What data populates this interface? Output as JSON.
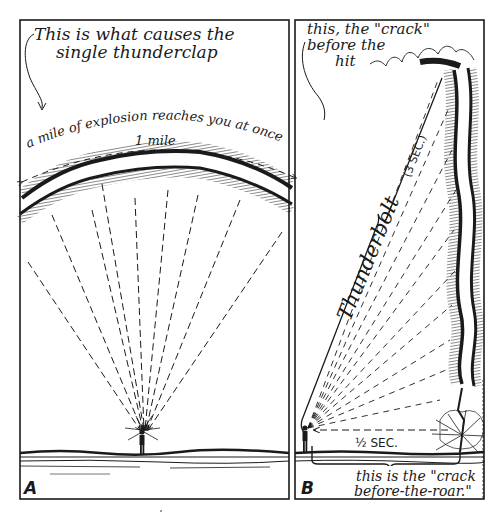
{
  "panel_a": {
    "label": "A",
    "title_line1": "This is what causes the",
    "title_line2": "single thunderclap",
    "arc_caption": "a mile of explosion reaches you at once",
    "distance_label": "1 mile"
  },
  "panel_b": {
    "label": "B",
    "crack_line1": "this, the \"crack\"",
    "crack_line2": "before the",
    "crack_line3": "hit",
    "bolt_label": "Thunderbolt",
    "bolt_duration": "(3 SEC.)",
    "half_sec": "½ SEC.",
    "roar_line1": "this is the \"crack",
    "roar_line2": "before-the-roar.\""
  },
  "colors": {
    "ink": "#1a1a1a",
    "paper": "#ffffff"
  }
}
